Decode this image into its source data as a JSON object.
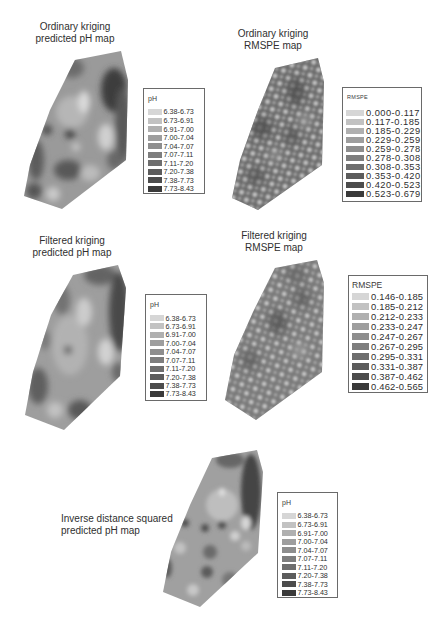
{
  "panels": [
    {
      "title_line1": "Ordinary kriging",
      "title_line2": "predicted pH map",
      "legend": {
        "title": "pH",
        "items": [
          {
            "range": "6.38-6.73",
            "color": "#d6d6d6"
          },
          {
            "range": "6.73-6.91",
            "color": "#c2c2c2"
          },
          {
            "range": "6.91-7.00",
            "color": "#b0b0b0"
          },
          {
            "range": "7.00-7.04",
            "color": "#9e9e9e"
          },
          {
            "range": "7.04-7.07",
            "color": "#8e8e8e"
          },
          {
            "range": "7.07-7.11",
            "color": "#7e7e7e"
          },
          {
            "range": "7.11-7.20",
            "color": "#6e6e6e"
          },
          {
            "range": "7.20-7.38",
            "color": "#5c5c5c"
          },
          {
            "range": "7.38-7.73",
            "color": "#4c4c4c"
          },
          {
            "range": "7.73-8.43",
            "color": "#3a3a3a"
          }
        ]
      }
    },
    {
      "title_line1": "Ordinary kriging",
      "title_line2": "RMSPE map",
      "legend": {
        "title": "RMSPE",
        "items": [
          {
            "range": "0.000-0.117",
            "color": "#d6d6d6"
          },
          {
            "range": "0.117-0.185",
            "color": "#c2c2c2"
          },
          {
            "range": "0.185-0.229",
            "color": "#b0b0b0"
          },
          {
            "range": "0.229-0.259",
            "color": "#9e9e9e"
          },
          {
            "range": "0.259-0.278",
            "color": "#8e8e8e"
          },
          {
            "range": "0.278-0.308",
            "color": "#7e7e7e"
          },
          {
            "range": "0.308-0.353",
            "color": "#6e6e6e"
          },
          {
            "range": "0.353-0.420",
            "color": "#5c5c5c"
          },
          {
            "range": "0.420-0.523",
            "color": "#4c4c4c"
          },
          {
            "range": "0.523-0.679",
            "color": "#3a3a3a"
          }
        ]
      }
    },
    {
      "title_line1": "Filtered kriging",
      "title_line2": "predicted pH map",
      "legend": {
        "title": "pH",
        "items": [
          {
            "range": "6.38-6.73",
            "color": "#d6d6d6"
          },
          {
            "range": "6.73-6.91",
            "color": "#c2c2c2"
          },
          {
            "range": "6.91-7.00",
            "color": "#b0b0b0"
          },
          {
            "range": "7.00-7.04",
            "color": "#9e9e9e"
          },
          {
            "range": "7.04-7.07",
            "color": "#8e8e8e"
          },
          {
            "range": "7.07-7.11",
            "color": "#7e7e7e"
          },
          {
            "range": "7.11-7.20",
            "color": "#6e6e6e"
          },
          {
            "range": "7.20-7.38",
            "color": "#5c5c5c"
          },
          {
            "range": "7.38-7.73",
            "color": "#4c4c4c"
          },
          {
            "range": "7.73-8.43",
            "color": "#3a3a3a"
          }
        ]
      }
    },
    {
      "title_line1": "Filtered kriging",
      "title_line2": "RMSPE map",
      "legend": {
        "title": "RMSPE",
        "items": [
          {
            "range": "0.146-0.185",
            "color": "#d6d6d6"
          },
          {
            "range": "0.185-0.212",
            "color": "#c2c2c2"
          },
          {
            "range": "0.212-0.233",
            "color": "#b0b0b0"
          },
          {
            "range": "0.233-0.247",
            "color": "#9e9e9e"
          },
          {
            "range": "0.247-0.267",
            "color": "#8e8e8e"
          },
          {
            "range": "0.267-0.295",
            "color": "#7e7e7e"
          },
          {
            "range": "0.295-0.331",
            "color": "#6e6e6e"
          },
          {
            "range": "0.331-0.387",
            "color": "#5c5c5c"
          },
          {
            "range": "0.387-0.462",
            "color": "#4c4c4c"
          },
          {
            "range": "0.462-0.565",
            "color": "#3a3a3a"
          }
        ]
      }
    },
    {
      "title_line1": "Inverse distance squared",
      "title_line2": "predicted pH map",
      "legend": {
        "title": "pH",
        "items": [
          {
            "range": "6.38-6.73",
            "color": "#d6d6d6"
          },
          {
            "range": "6.73-6.91",
            "color": "#c2c2c2"
          },
          {
            "range": "6.91-7.00",
            "color": "#b0b0b0"
          },
          {
            "range": "7.00-7.04",
            "color": "#9e9e9e"
          },
          {
            "range": "7.04-7.07",
            "color": "#8e8e8e"
          },
          {
            "range": "7.07-7.11",
            "color": "#7e7e7e"
          },
          {
            "range": "7.11-7.20",
            "color": "#6e6e6e"
          },
          {
            "range": "7.20-7.38",
            "color": "#5c5c5c"
          },
          {
            "range": "7.38-7.73",
            "color": "#4c4c4c"
          },
          {
            "range": "7.73-8.43",
            "color": "#3a3a3a"
          }
        ]
      }
    }
  ]
}
